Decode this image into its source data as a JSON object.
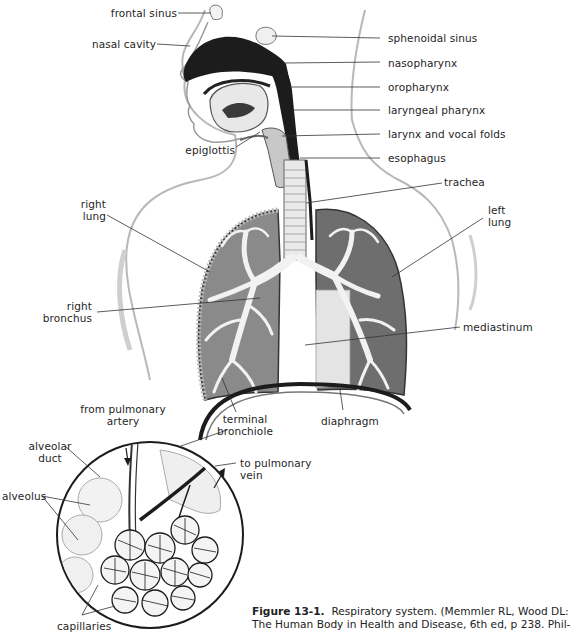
{
  "figure": {
    "type": "anatomical illustration",
    "subject": "Respiratory system",
    "labels": {
      "frontal_sinus": "frontal sinus",
      "nasal_cavity": "nasal cavity",
      "sphenoidal_sinus": "sphenoidal sinus",
      "nasopharynx": "nasopharynx",
      "oropharynx": "oropharynx",
      "laryngeal_pharynx": "laryngeal pharynx",
      "larynx_vocal_folds": "larynx and vocal folds",
      "epiglottis": "epiglottis",
      "esophagus": "esophagus",
      "trachea": "trachea",
      "right_lung_1": "right",
      "right_lung_2": "lung",
      "left_lung_1": "left",
      "left_lung_2": "lung",
      "right_bronchus_1": "right",
      "right_bronchus_2": "bronchus",
      "mediastinum": "mediastinum",
      "terminal_bronchiole_1": "terminal",
      "terminal_bronchiole_2": "bronchiole",
      "diaphragm": "diaphragm",
      "from_pulmonary_artery_1": "from pulmonary",
      "from_pulmonary_artery_2": "artery",
      "alveolar_duct_1": "alveolar",
      "alveolar_duct_2": "duct",
      "to_pulmonary_vein_1": "to pulmonary",
      "to_pulmonary_vein_2": "vein",
      "alveolus": "alveolus",
      "capillaries": "capillaries"
    },
    "caption": {
      "figure_number": "Figure 13-1.",
      "line1_text": "Respiratory system. (Memmler RL, Wood DL:",
      "line2_text": "The Human Body in Health and Disease, 6th ed, p 238. Phil-"
    }
  }
}
